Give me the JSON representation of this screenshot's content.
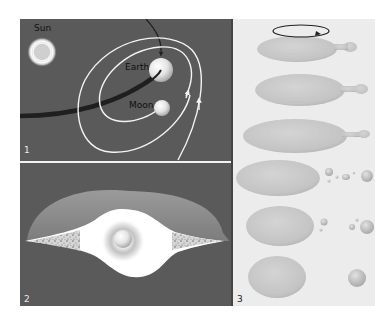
{
  "figure": {
    "panels": [
      {
        "number": "1",
        "description": "Earth-Moon system orbiting the Sun with impactor trajectories",
        "labels": {
          "sun": "Sun",
          "earth": "Earth",
          "moon": "Moon"
        }
      },
      {
        "number": "2",
        "description": "Cross-section of debris disk around proto-Earth"
      },
      {
        "number": "3",
        "description": "Sequence of spinning body elongating and shedding material"
      }
    ]
  },
  "colors": {
    "panel_dark_bg": "#5a5a5a",
    "panel_light_bg": "#ececec",
    "orbit_line": "#f4f4f4",
    "impactor_path": "#222222",
    "sphere_light": "#f2f2f2",
    "sphere_shadow": "#a8a8a8",
    "blob_fill": "#c9c9c9",
    "disk_outer": "#8c8c8c",
    "disk_inner": "#ffffff"
  }
}
